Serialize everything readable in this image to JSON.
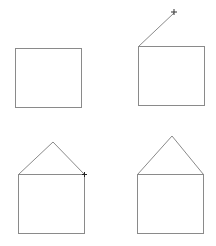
{
  "colors": {
    "stroke": "#8a8a8a",
    "marker": "#333333",
    "background": "#ffffff"
  },
  "panels": [
    {
      "step": 1,
      "description": "square only"
    },
    {
      "step": 2,
      "description": "square with first roof line being drawn, crosshair cursor at end"
    },
    {
      "step": 3,
      "description": "square with roof complete, cursor at right corner"
    },
    {
      "step": 4,
      "description": "completed house"
    }
  ]
}
